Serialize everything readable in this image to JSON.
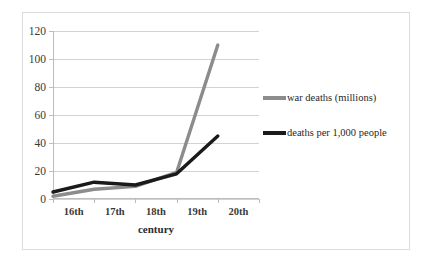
{
  "chart_data": {
    "type": "line",
    "title": "",
    "xlabel": "century",
    "ylabel": "",
    "categories": [
      "16th",
      "17th",
      "18th",
      "19th",
      "20th"
    ],
    "ylim": [
      0,
      120
    ],
    "yticks": [
      0,
      20,
      40,
      60,
      80,
      100,
      120
    ],
    "grid": true,
    "legend_position": "right",
    "series": [
      {
        "name": "war deaths (millions)",
        "color": "#8c8c8c",
        "values": [
          2,
          7,
          9,
          19,
          110
        ]
      },
      {
        "name": "deaths per 1,000 people",
        "color": "#1a1a1a",
        "values": [
          5,
          12,
          10,
          18,
          45
        ]
      }
    ]
  },
  "axis": {
    "y_tick_labels": [
      "0",
      "20",
      "40",
      "60",
      "80",
      "100",
      "120"
    ],
    "x_tick_labels": [
      "16th",
      "17th",
      "18th",
      "19th",
      "20th"
    ],
    "x_title": "century"
  },
  "legend": {
    "entries": [
      {
        "label": "war deaths (millions)",
        "color": "#8c8c8c"
      },
      {
        "label": "deaths per 1,000 people",
        "color": "#1a1a1a"
      }
    ]
  },
  "colors": {
    "gridline": "#d2d2d2",
    "axis": "#bdbdbd",
    "border": "#dcdcdc",
    "background": "#ffffff",
    "series_gray": "#8c8c8c",
    "series_black": "#1a1a1a"
  }
}
